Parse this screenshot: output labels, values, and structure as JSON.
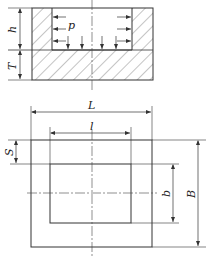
{
  "diagram": {
    "title": "",
    "type": "engineering-drawing",
    "views": [
      {
        "name": "section-view",
        "description": "Cross-section of cavity with hatched wall and bottom, pressure p acting on walls and bottom"
      },
      {
        "name": "plan-view",
        "description": "Top view showing outer and inner rectangles"
      }
    ],
    "labels": {
      "h": "h",
      "T": "T",
      "p": "p",
      "L": "L",
      "l": "l",
      "S": "S",
      "b": "b",
      "B": "B"
    },
    "colors": {
      "line": "#333333",
      "hatch": "#555555",
      "background": "#ffffff"
    }
  }
}
